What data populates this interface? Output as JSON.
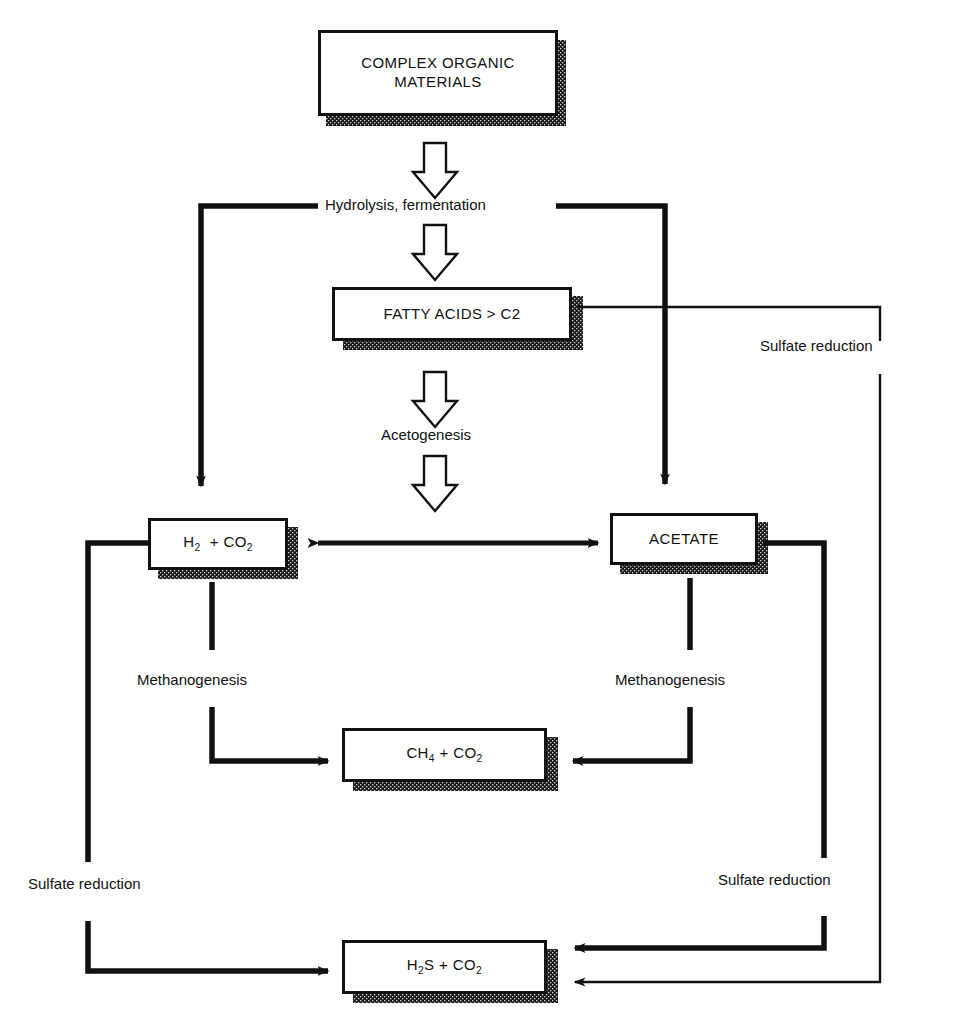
{
  "diagram": {
    "colors": {
      "ink": "#111111",
      "paper": "#ffffff",
      "shadow": "#2b2b2b"
    },
    "nodes": [
      {
        "id": "complex_organic",
        "label": "COMPLEX ORGANIC MATERIALS",
        "line1": "COMPLEX ORGANIC",
        "line2": "MATERIALS"
      },
      {
        "id": "fatty_acids",
        "label": "FATTY ACIDS > C2"
      },
      {
        "id": "h2_co2",
        "label": "H2 + CO2",
        "html": "H<sub>2</sub> &nbsp;+ CO<sub>2</sub>"
      },
      {
        "id": "acetate",
        "label": "ACETATE"
      },
      {
        "id": "ch4_co2",
        "label": "CH4 + CO2",
        "html": "CH<sub>4</sub> + CO<sub>2</sub>"
      },
      {
        "id": "h2s_co2",
        "label": "H2S + CO2",
        "html": "H<sub>2</sub>S + CO<sub>2</sub>"
      }
    ],
    "process_labels": [
      {
        "id": "hydrolysis",
        "text": "Hydrolysis, fermentation"
      },
      {
        "id": "acetogenesis",
        "text": "Acetogenesis"
      },
      {
        "id": "methanogenesis_left",
        "text": "Methanogenesis"
      },
      {
        "id": "methanogenesis_right",
        "text": "Methanogenesis"
      },
      {
        "id": "sulfate_right_upper",
        "text": "Sulfate reduction"
      },
      {
        "id": "sulfate_left_lower",
        "text": "Sulfate reduction"
      },
      {
        "id": "sulfate_right_lower",
        "text": "Sulfate reduction"
      }
    ],
    "flows": [
      {
        "from": "complex_organic",
        "to": "hydrolysis",
        "style": "hollow-block-arrow"
      },
      {
        "from": "hydrolysis",
        "to": "fatty_acids",
        "style": "hollow-block-arrow"
      },
      {
        "from": "fatty_acids",
        "to": "acetogenesis",
        "style": "hollow-block-arrow"
      },
      {
        "from": "acetogenesis",
        "to": "midline",
        "style": "hollow-block-arrow"
      },
      {
        "from": "hydrolysis",
        "to": "h2_co2",
        "style": "elbow-arrow-left"
      },
      {
        "from": "hydrolysis",
        "to": "acetate",
        "style": "elbow-arrow-right"
      },
      {
        "from": "h2_co2",
        "to": "acetate",
        "style": "double-headed-arrow"
      },
      {
        "from": "h2_co2",
        "to": "ch4_co2",
        "style": "elbow-arrow",
        "label": "Methanogenesis"
      },
      {
        "from": "acetate",
        "to": "ch4_co2",
        "style": "elbow-arrow",
        "label": "Methanogenesis"
      },
      {
        "from": "h2_co2",
        "to": "h2s_co2",
        "style": "elbow-arrow",
        "label": "Sulfate reduction"
      },
      {
        "from": "acetate",
        "to": "h2s_co2",
        "style": "elbow-arrow",
        "label": "Sulfate reduction"
      },
      {
        "from": "fatty_acids",
        "to": "h2s_co2",
        "style": "thin-elbow-arrow",
        "label": "Sulfate reduction"
      }
    ]
  }
}
